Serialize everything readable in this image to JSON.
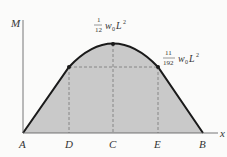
{
  "diagram": {
    "axes": {
      "y_label": "M",
      "x_label": "x"
    },
    "points": [
      {
        "id": "A",
        "label": "A"
      },
      {
        "id": "D",
        "label": "D"
      },
      {
        "id": "C",
        "label": "C"
      },
      {
        "id": "E",
        "label": "E"
      },
      {
        "id": "B",
        "label": "B"
      }
    ],
    "annotations": {
      "max": {
        "num": "1",
        "den": "12",
        "expr": "w",
        "sub": "0",
        "var": "L",
        "sup": "2"
      },
      "quarter": {
        "num": "11",
        "den": "192",
        "expr": "w",
        "sub": "0",
        "var": "L",
        "sup": "2"
      }
    },
    "colors": {
      "fill": "#c9c9c9",
      "curve": "#1a1a1a",
      "axis": "#555555",
      "dash": "#777777"
    }
  }
}
